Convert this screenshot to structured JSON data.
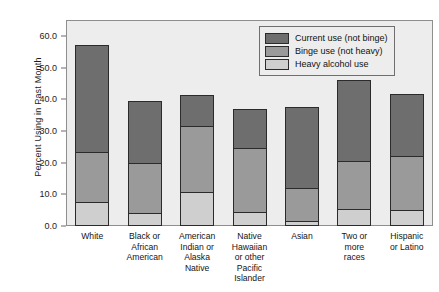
{
  "chart_data": {
    "type": "bar",
    "stacked": true,
    "title": "",
    "xlabel": "",
    "ylabel": "Percent Using in Past Month",
    "ylim": [
      0,
      65
    ],
    "ytick_values": [
      0.0,
      10.0,
      20.0,
      30.0,
      40.0,
      50.0,
      60.0
    ],
    "ytick_labels": [
      "0.0",
      "10.0",
      "20.0",
      "30.0",
      "40.0",
      "50.0",
      "60.0"
    ],
    "grid": false,
    "legend_position": "top-right",
    "categories": [
      "White",
      "Black or African American",
      "American Indian or Alaska Native",
      "Native Hawaiian or other Pacific Islander",
      "Asian",
      "Two or more races",
      "Hispanic or Latino"
    ],
    "category_label_lines": [
      [
        "White"
      ],
      [
        "Black or",
        "African",
        "American"
      ],
      [
        "American",
        "Indian or",
        "Alaska",
        "Native"
      ],
      [
        "Native",
        "Hawaiian",
        "or other",
        "Pacific",
        "Islander"
      ],
      [
        "Asian"
      ],
      [
        "Two or",
        "more",
        "races"
      ],
      [
        "Hispanic",
        "or Latino"
      ]
    ],
    "series": [
      {
        "name": "Heavy alcohol use",
        "color": "#cfcfcf",
        "values": [
          7.5,
          4.0,
          10.8,
          4.5,
          1.5,
          5.5,
          5.0
        ]
      },
      {
        "name": "Binge use (not heavy)",
        "color": "#9a9a9a",
        "values": [
          16.0,
          16.0,
          20.7,
          20.0,
          10.5,
          15.0,
          17.0
        ]
      },
      {
        "name": "Current use (not binge)",
        "color": "#6e6e6e",
        "values": [
          33.5,
          19.5,
          10.0,
          12.5,
          25.5,
          25.5,
          19.5
        ]
      }
    ],
    "segment_tops": {
      "heavy": [
        7.5,
        4.0,
        10.8,
        4.5,
        1.5,
        5.5,
        5.0
      ],
      "binge": [
        23.5,
        20.0,
        31.5,
        24.5,
        12.0,
        20.5,
        22.0
      ],
      "total": [
        57.0,
        39.5,
        41.5,
        37.0,
        37.5,
        46.0,
        41.5
      ]
    }
  },
  "legend": {
    "entries": [
      {
        "label": "Current use (not binge)",
        "color": "#6e6e6e"
      },
      {
        "label": "Binge use (not heavy)",
        "color": "#9a9a9a"
      },
      {
        "label": "Heavy alcohol use",
        "color": "#cfcfcf"
      }
    ]
  }
}
